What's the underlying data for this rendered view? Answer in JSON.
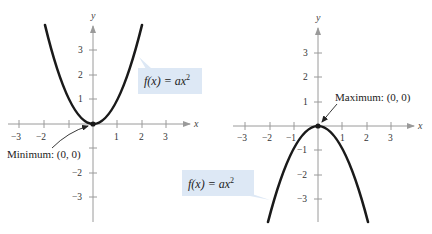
{
  "figure": {
    "left_graph": {
      "function_label": "f(x) = ax²",
      "function_label_parts": {
        "prefix": "f(x) = ax",
        "exponent": "2"
      },
      "annotation": "Minimum: (0, 0)",
      "x_axis_label": "x",
      "y_axis_label": "y",
      "x_ticks": [
        "−3",
        "−2",
        "1",
        "2",
        "3"
      ],
      "y_ticks": [
        "3",
        "2",
        "1",
        "−2",
        "−3"
      ],
      "opens": "upward"
    },
    "right_graph": {
      "function_label": "f(x) = ax²",
      "function_label_parts": {
        "prefix": "f(x) = ax",
        "exponent": "2"
      },
      "annotation": "Maximum: (0, 0)",
      "x_axis_label": "x",
      "y_axis_label": "y",
      "x_ticks": [
        "−3",
        "−2",
        "−1",
        "1",
        "2",
        "3"
      ],
      "y_ticks": [
        "3",
        "2",
        "1",
        "−1",
        "−2",
        "−3"
      ],
      "opens": "downward"
    },
    "colors": {
      "curve": "#1a1a1a",
      "axis": "#9a9a9a",
      "label_box": "#dde8f5"
    }
  }
}
